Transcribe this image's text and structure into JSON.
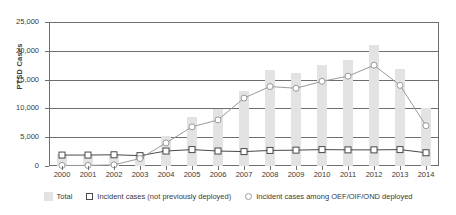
{
  "chart_data": {
    "type": "bar",
    "title": "",
    "xlabel": "",
    "ylabel": "PTSD Cases",
    "ylim": [
      0,
      25000
    ],
    "yticks": [
      0,
      5000,
      10000,
      15000,
      20000,
      25000
    ],
    "ytick_labels": [
      "0",
      "5,000",
      "10,000",
      "15,000",
      "20,000",
      "25,000"
    ],
    "grid": true,
    "legend_position": "bottom",
    "categories": [
      "2000",
      "2001",
      "2002",
      "2003",
      "2004",
      "2005",
      "2006",
      "2007",
      "2008",
      "2009",
      "2010",
      "2011",
      "2012",
      "2013",
      "2014"
    ],
    "series": [
      {
        "name": "Total",
        "type": "bar",
        "color": "#e3e3e3",
        "values": [
          2000,
          1900,
          2000,
          2100,
          5200,
          8500,
          9900,
          13000,
          16600,
          16200,
          17600,
          18400,
          21000,
          16900,
          10100
        ]
      },
      {
        "name": "Incident cases (not previously deployed)",
        "type": "line",
        "marker": "square",
        "color": "#4a4a4a",
        "values": [
          1900,
          1900,
          1950,
          1800,
          2600,
          2850,
          2600,
          2500,
          2700,
          2750,
          2850,
          2800,
          2800,
          2850,
          2300
        ]
      },
      {
        "name": "Incident cases among OEF/OIF/OND deployed",
        "type": "line",
        "marker": "circle",
        "color": "#9a9a9a",
        "values": [
          100,
          100,
          200,
          1300,
          4000,
          6800,
          8000,
          11800,
          13800,
          13500,
          14700,
          15600,
          17500,
          14000,
          7000
        ]
      }
    ]
  },
  "legend": {
    "items": [
      {
        "label": "Total",
        "marker": "bar-swatch"
      },
      {
        "label": "Incident cases (not previously deployed)",
        "marker": "square-marker"
      },
      {
        "label": "Incident cases among OEF/OIF/OND deployed",
        "marker": "circle-marker"
      }
    ]
  }
}
